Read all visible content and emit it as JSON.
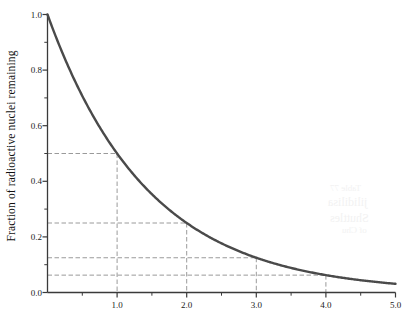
{
  "figure": {
    "background_color": "#ffffff",
    "curve_color": "#4a4a4a",
    "axis_color": "#3a3a3a",
    "guide_color": "#9a9a9a",
    "text_color": "#1a1a1a"
  },
  "axes": {
    "ylabel": "Fraction of radioactive nuclei remaining",
    "xlabel": "",
    "y_major_labels": [
      "0.0",
      "0.2",
      "0.4",
      "0.6",
      "0.8",
      "1.0"
    ],
    "y_major_values": [
      0.0,
      0.2,
      0.4,
      0.6,
      0.8,
      1.0
    ],
    "y_minor_values": [
      0.1,
      0.3,
      0.5,
      0.7,
      0.9
    ],
    "x_major_labels": [
      "1.0",
      "2.0",
      "3.0",
      "4.0",
      "5.0"
    ],
    "x_major_values": [
      1.0,
      2.0,
      3.0,
      4.0,
      5.0
    ],
    "x_minor_values": [
      0.5,
      1.5,
      2.5,
      3.5,
      4.5
    ],
    "xlim": [
      0.0,
      5.0
    ],
    "ylim": [
      0.0,
      1.0
    ],
    "grid": "none"
  },
  "showthrough_text": {
    "line1": "Table 77",
    "line2": "jilidilisa",
    "line3": "Shuttles",
    "line4": "of Chu"
  },
  "chart_data": {
    "type": "line",
    "title": "",
    "subtitle": "",
    "xlabel": "",
    "ylabel": "Fraction of radioactive nuclei remaining",
    "xlim": [
      0.0,
      5.0
    ],
    "ylim": [
      0.0,
      1.0
    ],
    "grid": false,
    "legend": "none",
    "series": [
      {
        "name": "Fraction of radioactive nuclei remaining",
        "formula": "0.5 ^ x",
        "x": [
          0.0,
          0.25,
          0.5,
          0.75,
          1.0,
          1.25,
          1.5,
          1.75,
          2.0,
          2.25,
          2.5,
          2.75,
          3.0,
          3.25,
          3.5,
          3.75,
          4.0,
          4.25,
          4.5,
          4.75,
          5.0
        ],
        "y": [
          1.0,
          0.841,
          0.707,
          0.595,
          0.5,
          0.42,
          0.354,
          0.297,
          0.25,
          0.21,
          0.177,
          0.149,
          0.125,
          0.105,
          0.088,
          0.074,
          0.0625,
          0.053,
          0.044,
          0.037,
          0.031
        ]
      }
    ],
    "annotations": [
      {
        "label": "half-life 1",
        "x": 1.0,
        "y": 0.5,
        "guide": "dashed"
      },
      {
        "label": "half-life 2",
        "x": 2.0,
        "y": 0.25,
        "guide": "dashed"
      },
      {
        "label": "half-life 3",
        "x": 3.0,
        "y": 0.125,
        "guide": "dashed"
      },
      {
        "label": "half-life 4",
        "x": 4.0,
        "y": 0.0625,
        "guide": "dashed"
      }
    ],
    "guide_lines": [
      {
        "y": 0.5,
        "x_to": 1.0
      },
      {
        "y": 0.25,
        "x_to": 2.0
      },
      {
        "y": 0.125,
        "x_to": 3.0
      },
      {
        "y": 0.0625,
        "x_to": 4.0
      }
    ]
  }
}
